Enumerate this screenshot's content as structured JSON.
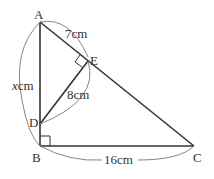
{
  "diagram": {
    "type": "geometry",
    "points": {
      "A": {
        "label": "A"
      },
      "B": {
        "label": "B"
      },
      "C": {
        "label": "C"
      },
      "D": {
        "label": "D"
      },
      "E": {
        "label": "E"
      }
    },
    "measurements": {
      "AE": "7cm",
      "DE": "8cm",
      "BC": "16cm",
      "AB_var": "x",
      "AB_unit": "cm"
    },
    "right_angles": [
      "B",
      "E"
    ],
    "colors": {
      "line": "#333333",
      "arc": "#777777",
      "text": "#333333"
    }
  }
}
